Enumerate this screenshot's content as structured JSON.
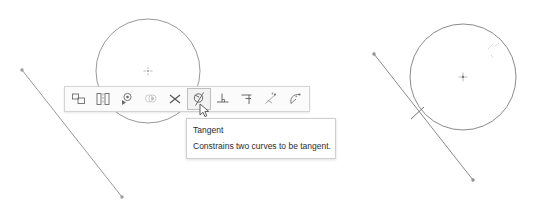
{
  "app": {
    "title": "CAD sketch constraint toolbar",
    "canvas_width": 546,
    "canvas_height": 208
  },
  "colors": {
    "background": "#ffffff",
    "geometry_stroke": "#6e6e6e",
    "geometry_point": "#8a8a8a",
    "toolbar_background": "#fbfbfb",
    "toolbar_border": "#d4d4d4",
    "toolbar_selected_background": "#f2f2f2",
    "toolbar_selected_border": "#bfbfbf",
    "tooltip_background": "#ffffff",
    "tooltip_border": "#cfcfcf",
    "tooltip_text": "#2b2b2b",
    "icon_stroke": "#5a5a5a",
    "icon_stroke_faded": "#b4b4b4"
  },
  "toolbar": {
    "name": "constraint-toolbar",
    "x": 64,
    "y": 86,
    "items": [
      {
        "id": "equal",
        "icon": "equal-constraint-icon",
        "label": "Equal",
        "selected": false,
        "enabled": true
      },
      {
        "id": "symmetric",
        "icon": "symmetric-constraint-icon",
        "label": "Symmetric",
        "selected": false,
        "enabled": true
      },
      {
        "id": "concentric",
        "icon": "concentric-constraint-icon",
        "label": "Concentric",
        "selected": false,
        "enabled": true
      },
      {
        "id": "coincident",
        "icon": "coincident-constraint-icon",
        "label": "Coincident",
        "selected": false,
        "enabled": false
      },
      {
        "id": "delete",
        "icon": "delete-constraint-icon",
        "label": "Delete",
        "selected": false,
        "enabled": true
      },
      {
        "id": "tangent",
        "icon": "tangent-constraint-icon",
        "label": "Tangent",
        "selected": true,
        "enabled": true
      },
      {
        "id": "perpendicular",
        "icon": "perpendicular-constraint-icon",
        "label": "Perpendicular",
        "selected": false,
        "enabled": true
      },
      {
        "id": "parallel",
        "icon": "parallel-constraint-icon",
        "label": "Parallel",
        "selected": false,
        "enabled": true
      },
      {
        "id": "midpoint",
        "icon": "midpoint-constraint-icon",
        "label": "Midpoint",
        "selected": false,
        "enabled": true
      },
      {
        "id": "curvature",
        "icon": "curvature-constraint-icon",
        "label": "Curvature",
        "selected": false,
        "enabled": true
      }
    ]
  },
  "tooltip": {
    "name": "tangent-tooltip",
    "title": "Tangent",
    "description": "Constrains two curves to be tangent.",
    "x": 186,
    "y": 118
  },
  "cursor": {
    "name": "mouse-pointer-cursor",
    "x": 199,
    "y": 103
  },
  "sketch_before": {
    "name": "sketch-before-constraint",
    "description": "Circle and line not yet tangent",
    "circle": {
      "cx": 148,
      "cy": 71,
      "r": 52,
      "center_marker": true
    },
    "line": {
      "x1": 22,
      "y1": 70,
      "x2": 122,
      "y2": 197
    },
    "endpoints": [
      {
        "x": 22,
        "y": 70
      },
      {
        "x": 122,
        "y": 197
      }
    ]
  },
  "sketch_after": {
    "name": "sketch-after-constraint",
    "description": "Circle and line constrained tangent, tangency marker shown",
    "circle": {
      "cx": 463,
      "cy": 77,
      "r": 53,
      "center_marker": true
    },
    "line": {
      "x1": 374,
      "y1": 54,
      "x2": 473,
      "y2": 180
    },
    "endpoints": [
      {
        "x": 374,
        "y": 54
      },
      {
        "x": 473,
        "y": 180
      }
    ],
    "tangency_marker": {
      "x": 417,
      "y": 113,
      "length": 15,
      "angle_deg": -38
    },
    "constraint_glyph": {
      "x": 492,
      "y": 50
    }
  }
}
